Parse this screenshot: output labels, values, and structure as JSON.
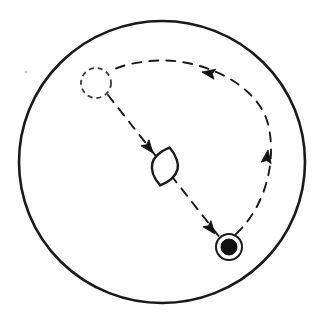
{
  "figure": {
    "background_color": "#fefefe",
    "stroke_color": "#1a1a1a",
    "fill_color": "#111111",
    "width": 322,
    "height": 317
  },
  "elements": {
    "boundary_circle": {
      "name": "outer-boundary-circle",
      "cx": 162,
      "cy": 162,
      "r": 141,
      "stroke_width": 2.6,
      "style": "solid",
      "label": ""
    },
    "start_marker": {
      "name": "dashed-start-circle",
      "cx": 96,
      "cy": 83,
      "r": 15,
      "stroke_width": 1.8,
      "style": "dashed",
      "dash_pattern": "5 4",
      "label": ""
    },
    "lens_marker": {
      "name": "lens-shape",
      "cx": 165,
      "cy": 166,
      "rx": 13,
      "ry": 19,
      "rotation_deg": 14,
      "stroke_width": 2.4,
      "style": "solid",
      "label": ""
    },
    "end_marker": {
      "name": "filled-target-dot",
      "cx": 229,
      "cy": 247,
      "outer_r": 13,
      "inner_r": 8,
      "stroke_width": 2.0,
      "style": "solid-filled",
      "label": ""
    },
    "straight_path": {
      "name": "dashed-straight-path",
      "from_x": 108,
      "from_y": 95,
      "to_x": 221,
      "to_y": 239,
      "style": "dashed",
      "dash_pattern": "9 8",
      "stroke_width": 1.9,
      "label": ""
    },
    "return_arc": {
      "name": "dashed-return-arc",
      "from_x": 235,
      "from_y": 234,
      "to_x": 113,
      "to_y": 70,
      "style": "dashed",
      "dash_pattern": "9 8",
      "stroke_width": 1.9,
      "label": ""
    },
    "arrowheads": [
      {
        "name": "arrowhead-toward-lens",
        "x": 152,
        "y": 152,
        "angle_deg": 52,
        "label": ""
      },
      {
        "name": "arrowhead-toward-target",
        "x": 213,
        "y": 230,
        "angle_deg": 52,
        "label": ""
      },
      {
        "name": "arrowhead-arc-upward",
        "x": 268,
        "y": 156,
        "angle_deg": -85,
        "label": ""
      },
      {
        "name": "arrowhead-arc-leftward",
        "x": 209,
        "y": 72,
        "angle_deg": -160,
        "label": ""
      }
    ],
    "speck": {
      "name": "stray-speck",
      "cx": 26,
      "cy": 72,
      "r": 1.2,
      "label": ""
    }
  }
}
